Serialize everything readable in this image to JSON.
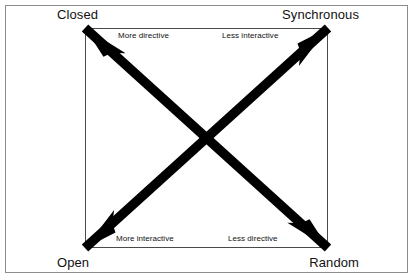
{
  "figure": {
    "type": "two-by-two-axes-diagram",
    "width": 415,
    "height": 280,
    "background_color": "#ffffff",
    "outer_frame": {
      "border_color": "#8d8d8d",
      "border_width": 1
    },
    "inner_box": {
      "border_color": "#4a4a4a",
      "border_width": 1,
      "left": 85,
      "top": 28,
      "width": 243,
      "height": 220
    },
    "arrow_color": "#000000",
    "corner_labels": {
      "top_left": "Closed",
      "top_right": "Synchronous",
      "bottom_left": "Open",
      "bottom_right": "Random"
    },
    "inner_labels": {
      "top_left": "More directive",
      "top_right": "Less interactive",
      "bottom_left": "More interactive",
      "bottom_right": "Less directive"
    },
    "arrows": [
      {
        "name": "diagonal-arrow-closed-random",
        "from_corner": "top_left",
        "to_corner": "bottom_right",
        "double_headed": true
      },
      {
        "name": "diagonal-arrow-open-synchronous",
        "from_corner": "bottom_left",
        "to_corner": "top_right",
        "double_headed": true
      }
    ]
  }
}
